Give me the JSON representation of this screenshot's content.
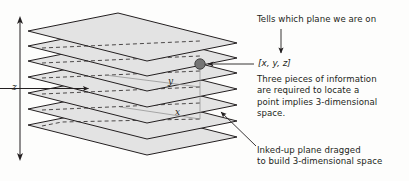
{
  "figure": {
    "type": "diagram",
    "background_color": "#fdfdfc",
    "line_color": "#231f20",
    "plane_fill": "#e3e3e3",
    "dot_color": "#6b6b6b"
  },
  "axes": {
    "z_label": "z",
    "x_label": "x",
    "y_label": "y"
  },
  "point": {
    "coordinate_label": "[x, y, z]"
  },
  "annotations": {
    "top": "Tells which plane we are on",
    "middle": "Three pieces of information\nare required to locate a\npoint implies 3-dimensional\nspace.",
    "bottom": "Inked-up plane dragged\nto build 3-dimensional space"
  },
  "planes": {
    "count": 7,
    "left_corner_y": [
      31,
      46,
      61,
      77,
      93,
      109,
      125
    ]
  }
}
